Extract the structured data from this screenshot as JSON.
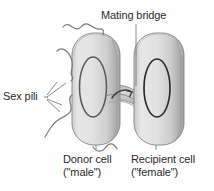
{
  "figure": {
    "background_color": "#ffffff",
    "labels": {
      "mating_bridge": "Mating bridge",
      "sex_pili": "Sex pili",
      "donor_cell": "Donor cell",
      "donor_cell_sub": "(\"male\")",
      "recipient_cell": "Recipient cell",
      "recipient_cell_sub": "(\"female\")"
    },
    "colors": {
      "text": "#2b2b2b",
      "leader_line": "#6e6e6e",
      "cell_fill_light": "#e4e4e4",
      "cell_fill_mid": "#d2d2d2",
      "cell_fill_dark": "#a9a9a9",
      "cell_outline": "#8a8a8a",
      "chromosome_outline": "#4a4a4a",
      "pilus_stroke": "#7a7a7a",
      "transfer_arrow": "#3d3d3d"
    },
    "parts": {
      "donor_cell_body": "rounded-capsule-cell",
      "recipient_cell_body": "rounded-capsule-cell",
      "donor_chromosome": "vertical-ellipse",
      "recipient_chromosome": "vertical-ellipse",
      "mating_bridge": "narrow-tube-connection",
      "transfer_arrow": "curved-arrow-dna-transfer",
      "pilus_top": "wavy-filament",
      "pilus_middle": "wavy-filament",
      "pilus_lower": "wavy-filament",
      "pilus_bottom": "wavy-filament"
    }
  }
}
